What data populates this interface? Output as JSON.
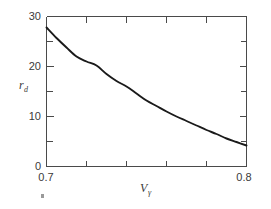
{
  "chart_data": {
    "type": "line",
    "title": "",
    "subtitle": "",
    "xlabel": "V",
    "xlabel_sub": "γ",
    "ylabel": "r",
    "ylabel_sub": "d",
    "xlim": [
      0.7,
      0.8
    ],
    "ylim": [
      0,
      30
    ],
    "grid": false,
    "legend": "none",
    "x_tick_labels": [
      "0.7",
      "0.8"
    ],
    "x_tick_values": [
      0.7,
      0.8
    ],
    "x_minor_ticks": [
      0.72,
      0.74,
      0.76,
      0.78
    ],
    "y_tick_labels": [
      "0",
      "10",
      "20",
      "30"
    ],
    "y_tick_values": [
      0,
      10,
      20,
      30
    ],
    "y_minor_ticks": [
      5,
      15,
      25
    ],
    "series": [
      {
        "name": "r_d vs V_gamma",
        "x": [
          0.7,
          0.705,
          0.71,
          0.715,
          0.72,
          0.725,
          0.73,
          0.735,
          0.74,
          0.745,
          0.75,
          0.755,
          0.76,
          0.765,
          0.77,
          0.775,
          0.78,
          0.785,
          0.79,
          0.795,
          0.8
        ],
        "values": [
          27.8,
          25.7,
          23.8,
          22.0,
          21.0,
          20.2,
          18.5,
          17.1,
          16.0,
          14.6,
          13.2,
          12.1,
          11.0,
          10.0,
          9.1,
          8.2,
          7.3,
          6.5,
          5.6,
          4.9,
          4.2
        ]
      }
    ]
  },
  "axes": {
    "y_label_main": "r",
    "y_label_subscript": "d",
    "x_label_main": "V",
    "x_label_subscript": "γ",
    "y_max_label": "30",
    "y_mid_label": "20",
    "y_low_label": "10",
    "y_zero_label": "0",
    "x_min_label": "0.7",
    "x_max_label": "0.8"
  },
  "artifacts": {
    "stray_mark": "·"
  },
  "colors": {
    "curve": "#1a1a1a",
    "axis": "#4a4a4a",
    "text": "#3a3a3a",
    "background": "#ffffff"
  }
}
